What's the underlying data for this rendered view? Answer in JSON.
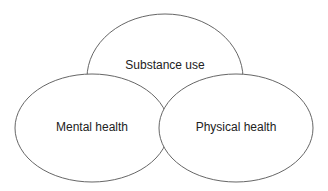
{
  "diagram": {
    "type": "venn-overlap",
    "nodes": [
      {
        "id": "substance",
        "label": "Substance use"
      },
      {
        "id": "mental",
        "label": "Mental health"
      },
      {
        "id": "physical",
        "label": "Physical health"
      }
    ],
    "colors": {
      "stroke": "#555555",
      "fill": "#ffffff",
      "text": "#222222"
    }
  }
}
